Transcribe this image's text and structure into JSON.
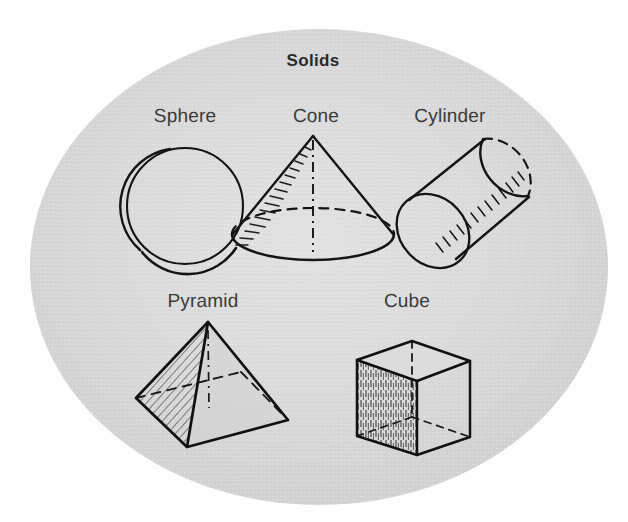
{
  "figure": {
    "title": "Solids",
    "background_color": "#ffffff",
    "plate_color": "#d8d8d8",
    "ink_color": "#1a1a1a",
    "label_color": "#3b3b3b",
    "plate_shape": "ellipse"
  },
  "labels": {
    "sphere": "Sphere",
    "cone": "Cone",
    "cylinder": "Cylinder",
    "pyramid": "Pyramid",
    "cube": "Cube"
  },
  "solids": [
    {
      "name": "sphere",
      "label": "Sphere",
      "row": 1,
      "column": 1,
      "label_center_x": 185,
      "label_baseline_y": 126,
      "shading": "cross-hatched crescent on lower-left limb",
      "hidden_lines": "none"
    },
    {
      "name": "cone",
      "label": "Cone",
      "row": 1,
      "column": 2,
      "label_center_x": 316,
      "label_baseline_y": 126,
      "shading": "short hatch strokes along left slant edge",
      "hidden_lines": "dashed rear half of base ellipse, dash-dot vertical axis"
    },
    {
      "name": "cylinder",
      "label": "Cylinder",
      "row": 1,
      "column": 3,
      "label_center_x": 450,
      "label_baseline_y": 126,
      "shading": "hatch strokes along lower-right wall",
      "hidden_lines": "dashed rear ellipse of far end"
    },
    {
      "name": "pyramid",
      "label": "Pyramid",
      "row": 2,
      "column": 1,
      "label_center_x": 203,
      "label_baseline_y": 311,
      "shading": "diagonal hatching on left face",
      "hidden_lines": "dashed edges to hidden rear base vertex"
    },
    {
      "name": "cube",
      "label": "Cube",
      "row": 2,
      "column": 2,
      "label_center_x": 407,
      "label_baseline_y": 311,
      "shading": "vertical hatching on left face",
      "hidden_lines": "dashed edges to hidden rear vertex"
    }
  ],
  "title_position": {
    "center_x": 313,
    "baseline_y": 69
  }
}
